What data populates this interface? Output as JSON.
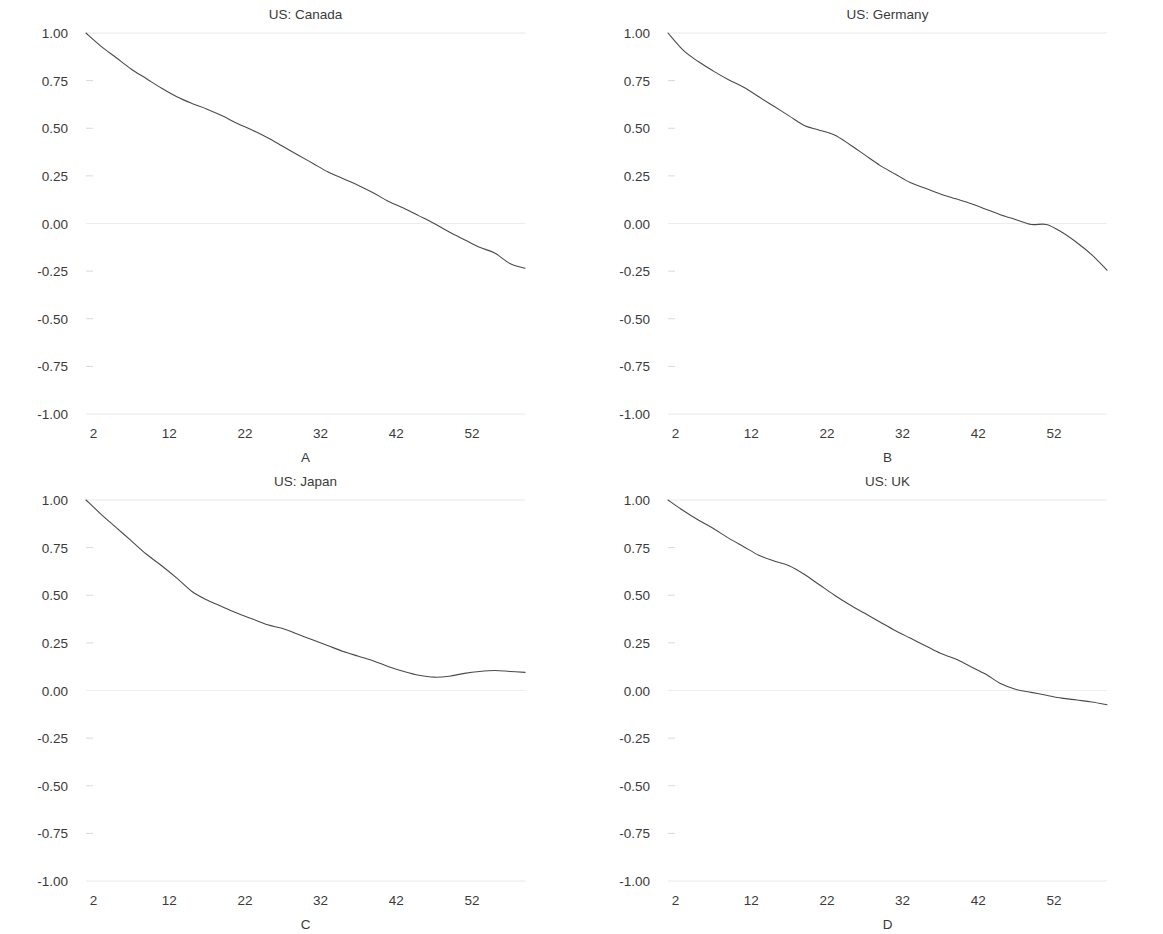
{
  "figure": {
    "layout": "2x2-panel-grid",
    "background": "#ffffff",
    "line_color": "#4a4a4a",
    "gridline_color": "#e8e8e8",
    "text_color": "#3a3a3a"
  },
  "chart_data": [
    {
      "type": "line",
      "title": "US: Canada",
      "panel_label": "A",
      "xlabel": "",
      "ylabel": "",
      "xlim": [
        1,
        59
      ],
      "ylim": [
        -1.0,
        1.0
      ],
      "xticks": [
        2,
        12,
        22,
        32,
        42,
        52
      ],
      "yticks": [
        1.0,
        0.75,
        0.5,
        0.25,
        0.0,
        -0.25,
        -0.5,
        -0.75,
        -1.0
      ],
      "ytick_labels": [
        "1.00",
        "0.75",
        "0.50",
        "0.25",
        "0.00",
        "-0.25",
        "-0.50",
        "-0.75",
        "-1.00"
      ],
      "xtick_labels": [
        "2",
        "12",
        "22",
        "32",
        "42",
        "52"
      ],
      "grid": "horizontal-at-1.00-0.00--1.00",
      "legend": "none",
      "x": [
        1,
        3,
        5,
        7,
        9,
        11,
        13,
        15,
        17,
        19,
        21,
        23,
        25,
        27,
        29,
        31,
        33,
        35,
        37,
        39,
        41,
        43,
        45,
        47,
        49,
        51,
        53,
        55,
        57,
        59
      ],
      "values": [
        1.0,
        0.93,
        0.87,
        0.81,
        0.76,
        0.71,
        0.665,
        0.63,
        0.6,
        0.565,
        0.525,
        0.49,
        0.45,
        0.405,
        0.36,
        0.315,
        0.27,
        0.235,
        0.2,
        0.16,
        0.115,
        0.08,
        0.04,
        0.0,
        -0.045,
        -0.085,
        -0.125,
        -0.155,
        -0.21,
        -0.235
      ]
    },
    {
      "type": "line",
      "title": "US: Germany",
      "panel_label": "B",
      "xlabel": "",
      "ylabel": "",
      "xlim": [
        1,
        59
      ],
      "ylim": [
        -1.0,
        1.0
      ],
      "xticks": [
        2,
        12,
        22,
        32,
        42,
        52
      ],
      "yticks": [
        1.0,
        0.75,
        0.5,
        0.25,
        0.0,
        -0.25,
        -0.5,
        -0.75,
        -1.0
      ],
      "ytick_labels": [
        "1.00",
        "0.75",
        "0.50",
        "0.25",
        "0.00",
        "-0.25",
        "-0.50",
        "-0.75",
        "-1.00"
      ],
      "xtick_labels": [
        "2",
        "12",
        "22",
        "32",
        "42",
        "52"
      ],
      "grid": "horizontal-at-1.00-0.00--1.00",
      "legend": "none",
      "x": [
        1,
        3,
        5,
        7,
        9,
        11,
        13,
        15,
        17,
        19,
        21,
        23,
        25,
        27,
        29,
        31,
        33,
        35,
        37,
        39,
        41,
        43,
        45,
        47,
        49,
        51,
        53,
        55,
        57,
        59
      ],
      "values": [
        1.0,
        0.91,
        0.85,
        0.8,
        0.755,
        0.715,
        0.665,
        0.615,
        0.565,
        0.515,
        0.49,
        0.465,
        0.415,
        0.36,
        0.305,
        0.26,
        0.215,
        0.185,
        0.155,
        0.13,
        0.105,
        0.075,
        0.045,
        0.02,
        -0.005,
        -0.005,
        -0.045,
        -0.1,
        -0.165,
        -0.245
      ]
    },
    {
      "type": "line",
      "title": "US: Japan",
      "panel_label": "C",
      "xlabel": "",
      "ylabel": "",
      "xlim": [
        1,
        59
      ],
      "ylim": [
        -1.0,
        1.0
      ],
      "xticks": [
        2,
        12,
        22,
        32,
        42,
        52
      ],
      "yticks": [
        1.0,
        0.75,
        0.5,
        0.25,
        0.0,
        -0.25,
        -0.5,
        -0.75,
        -1.0
      ],
      "ytick_labels": [
        "1.00",
        "0.75",
        "0.50",
        "0.25",
        "0.00",
        "-0.25",
        "-0.50",
        "-0.75",
        "-1.00"
      ],
      "xtick_labels": [
        "2",
        "12",
        "22",
        "32",
        "42",
        "52"
      ],
      "grid": "horizontal-at-1.00-0.00--1.00",
      "legend": "none",
      "x": [
        1,
        3,
        5,
        7,
        9,
        11,
        13,
        15,
        17,
        19,
        21,
        23,
        25,
        27,
        29,
        31,
        33,
        35,
        37,
        39,
        41,
        43,
        45,
        47,
        49,
        51,
        53,
        55,
        57,
        59
      ],
      "values": [
        1.0,
        0.925,
        0.855,
        0.785,
        0.715,
        0.655,
        0.59,
        0.52,
        0.475,
        0.44,
        0.405,
        0.375,
        0.345,
        0.325,
        0.295,
        0.265,
        0.235,
        0.205,
        0.18,
        0.155,
        0.125,
        0.1,
        0.08,
        0.07,
        0.075,
        0.09,
        0.1,
        0.105,
        0.1,
        0.095
      ]
    },
    {
      "type": "line",
      "title": "US: UK",
      "panel_label": "D",
      "xlabel": "",
      "ylabel": "",
      "xlim": [
        1,
        59
      ],
      "ylim": [
        -1.0,
        1.0
      ],
      "xticks": [
        2,
        12,
        22,
        32,
        42,
        52
      ],
      "yticks": [
        1.0,
        0.75,
        0.5,
        0.25,
        0.0,
        -0.25,
        -0.5,
        -0.75,
        -1.0
      ],
      "ytick_labels": [
        "1.00",
        "0.75",
        "0.50",
        "0.25",
        "0.00",
        "-0.25",
        "-0.50",
        "-0.75",
        "-1.00"
      ],
      "xtick_labels": [
        "2",
        "12",
        "22",
        "32",
        "42",
        "52"
      ],
      "grid": "horizontal-at-1.00-0.00--1.00",
      "legend": "none",
      "x": [
        1,
        3,
        5,
        7,
        9,
        11,
        13,
        15,
        17,
        19,
        21,
        23,
        25,
        27,
        29,
        31,
        33,
        35,
        37,
        39,
        41,
        43,
        45,
        47,
        49,
        51,
        53,
        55,
        57,
        59
      ],
      "values": [
        1.0,
        0.945,
        0.895,
        0.85,
        0.8,
        0.755,
        0.71,
        0.68,
        0.655,
        0.61,
        0.555,
        0.5,
        0.45,
        0.405,
        0.36,
        0.315,
        0.275,
        0.235,
        0.195,
        0.165,
        0.125,
        0.085,
        0.035,
        0.005,
        -0.01,
        -0.025,
        -0.04,
        -0.05,
        -0.06,
        -0.075
      ]
    }
  ]
}
